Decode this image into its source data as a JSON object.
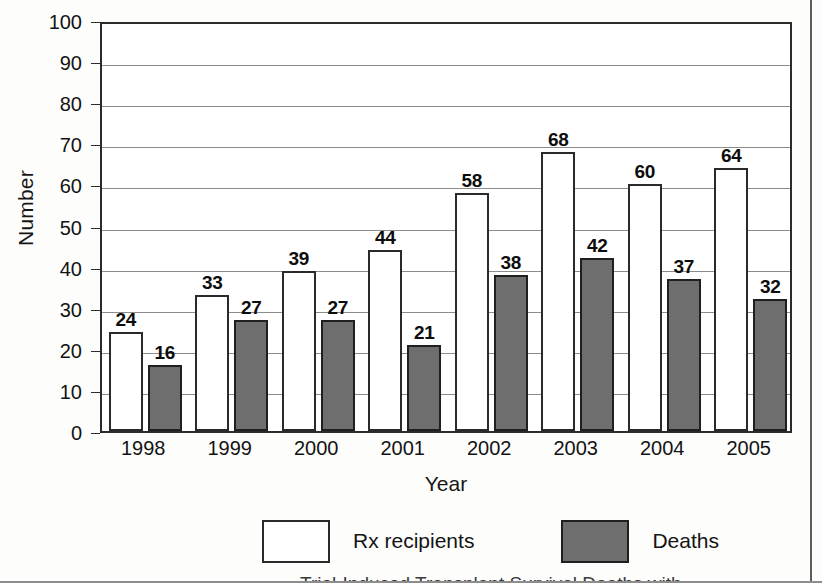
{
  "figure": {
    "y_axis_title": "Number",
    "x_axis_title": "Year"
  },
  "legend": {
    "items": [
      {
        "label": "Rx recipients",
        "swatch": "white-box",
        "color": "#ffffff"
      },
      {
        "label": "Deaths",
        "swatch": "gray-box",
        "color": "#6e6e6e"
      }
    ]
  },
  "caption_partial": "Trial-Induced Transplant Survival Deaths with",
  "chart_data": {
    "type": "bar",
    "title": "",
    "xlabel": "Year",
    "ylabel": "Number",
    "categories": [
      "1998",
      "1999",
      "2000",
      "2001",
      "2002",
      "2003",
      "2004",
      "2005"
    ],
    "series": [
      {
        "name": "Rx recipients",
        "color": "#ffffff",
        "values": [
          24,
          33,
          39,
          44,
          58,
          68,
          60,
          64
        ]
      },
      {
        "name": "Deaths",
        "color": "#6e6e6e",
        "values": [
          16,
          27,
          27,
          21,
          38,
          42,
          37,
          32
        ]
      }
    ],
    "ylim": [
      0,
      100
    ],
    "yticks": [
      0,
      10,
      20,
      30,
      40,
      50,
      60,
      70,
      80,
      90,
      100
    ],
    "grid": true,
    "grid_axis": "y",
    "legend_position": "bottom",
    "data_labels": true
  }
}
